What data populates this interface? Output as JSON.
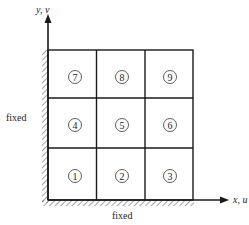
{
  "diagram": {
    "axes": {
      "x_label": "x, u",
      "y_label": "y, v"
    },
    "boundaries": {
      "left_label": "fixed",
      "bottom_label": "fixed"
    },
    "grid": {
      "rows": 3,
      "cols": 3,
      "elements": [
        "1",
        "2",
        "3",
        "4",
        "5",
        "6",
        "7",
        "8",
        "9"
      ]
    },
    "colors": {
      "line": "#1a1a1a",
      "hatch": "#555555",
      "background": "#ffffff"
    }
  }
}
